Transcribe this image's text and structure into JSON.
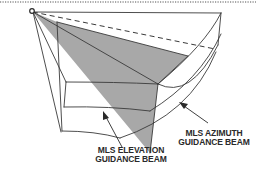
{
  "diagram": {
    "type": "3D beam coverage illustration",
    "colors": {
      "line": "#3a3a3a",
      "shaded_beam": "#a8a8a8",
      "background": "#ffffff",
      "dotted_border": "#555555"
    },
    "labels": {
      "azimuth": {
        "line1": "MLS AZIMUTH",
        "line2": "GUIDANCE BEAM"
      },
      "elevation": {
        "line1": "MLS ELEVATION",
        "line2": "GUIDANCE BEAM"
      }
    },
    "elements": [
      "dotted-top-border",
      "origin-point",
      "coverage-volume-wireframe",
      "azimuth-beam-shaded-wedge",
      "centerline-dashed",
      "azimuth-pointer-arrow",
      "elevation-pointer-arrow"
    ]
  }
}
